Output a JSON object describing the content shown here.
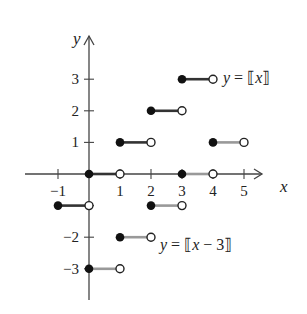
{
  "chart_data": {
    "type": "line",
    "title": "",
    "xlabel": "x",
    "ylabel": "y",
    "xlim": [
      -1.5,
      6
    ],
    "ylim": [
      -3.8,
      4.5
    ],
    "grid": false,
    "x_ticks": [
      -1,
      1,
      2,
      3,
      4,
      5
    ],
    "x_tick_labels": [
      "−1",
      "1",
      "2",
      "3",
      "4",
      "5"
    ],
    "y_ticks": [
      -3,
      -2,
      -1,
      1,
      2,
      3
    ],
    "y_tick_labels": [
      "−3",
      "−2",
      "",
      "1",
      "2",
      "3"
    ],
    "series": [
      {
        "name": "y = [[x]]",
        "label": "y = ⟦x⟧",
        "color": "#333333",
        "segments": [
          {
            "x0": -1,
            "x1": 0,
            "y": -1,
            "closed_left": true,
            "open_right": true
          },
          {
            "x0": 0,
            "x1": 1,
            "y": 0,
            "closed_left": true,
            "open_right": true
          },
          {
            "x0": 1,
            "x1": 2,
            "y": 1,
            "closed_left": true,
            "open_right": true
          },
          {
            "x0": 2,
            "x1": 3,
            "y": 2,
            "closed_left": true,
            "open_right": true
          },
          {
            "x0": 3,
            "x1": 4,
            "y": 3,
            "closed_left": true,
            "open_right": true
          }
        ]
      },
      {
        "name": "y = [[x - 3]]",
        "label": "y = ⟦x − 3⟧",
        "color": "#999999",
        "segments": [
          {
            "x0": 0,
            "x1": 1,
            "y": -3,
            "closed_left": true,
            "open_right": true
          },
          {
            "x0": 1,
            "x1": 2,
            "y": -2,
            "closed_left": true,
            "open_right": true
          },
          {
            "x0": 2,
            "x1": 3,
            "y": -1,
            "closed_left": true,
            "open_right": true
          },
          {
            "x0": 3,
            "x1": 4,
            "y": 0,
            "closed_left": true,
            "open_right": true
          },
          {
            "x0": 4,
            "x1": 5,
            "y": 1,
            "closed_left": true,
            "open_right": true
          }
        ]
      }
    ],
    "annotations": [
      {
        "text": "y = ⟦x⟧",
        "near": [
          4,
          3
        ]
      },
      {
        "text": "y = ⟦x − 3⟧",
        "near": [
          2,
          -2
        ]
      }
    ]
  },
  "labels": {
    "x_axis": "x",
    "y_axis": "y",
    "eq1_y": "y",
    "eq1_rest_a": " = ⟦",
    "eq1_var": "x",
    "eq1_rest_b": "⟧",
    "eq2_y": "y",
    "eq2_rest_a": " = ⟦",
    "eq2_var": "x",
    "eq2_rest_b": " − 3⟧"
  }
}
